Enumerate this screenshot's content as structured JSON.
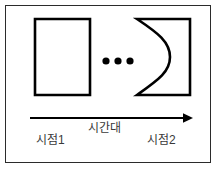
{
  "figure": {
    "type": "diagram",
    "description_kind": "time-axis-diagram",
    "background_color": "#ffffff",
    "stroke_color": "#000000",
    "frame_color": "#2b2b2b",
    "text_color": "#3a3a3a"
  },
  "shapes": {
    "left_shape": {
      "name": "rectangle",
      "x": 35,
      "y": 19,
      "width": 55,
      "height": 76,
      "stroke_width": 2.6
    },
    "right_shape": {
      "name": "concave-left-rectangle",
      "x": 137,
      "y": 19,
      "width": 53,
      "height": 76,
      "stroke_width": 2.6,
      "curve_bulge_x": 162
    },
    "ellipsis": {
      "name": "three-dots",
      "count": 3,
      "cy": 61,
      "radius": 3.6,
      "cx_values": [
        106,
        118,
        130
      ]
    },
    "arrow": {
      "name": "time-arrow",
      "x1": 30,
      "x2": 193,
      "y": 118,
      "stroke_width": 1.6,
      "head_length": 9,
      "head_half_height": 4.5
    }
  },
  "labels": {
    "start": "시점1",
    "span": "시간대",
    "end": "시점2"
  }
}
